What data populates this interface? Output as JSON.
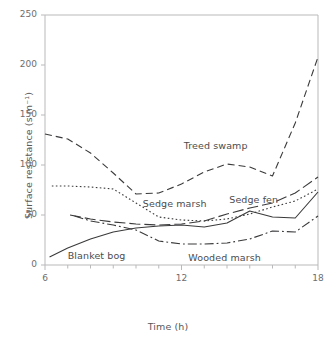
{
  "chart_data": {
    "type": "line",
    "title": "",
    "xlabel": "Time (h)",
    "ylabel": "Surface resistance (s m⁻¹)",
    "xlim": [
      6,
      18
    ],
    "ylim": [
      0,
      250
    ],
    "xticks": [
      6,
      12,
      18
    ],
    "xtick_labels": [
      "6",
      "12",
      "18"
    ],
    "yticks": [
      0,
      50,
      100,
      150,
      200,
      250
    ],
    "ytick_labels": [
      "0",
      "50",
      "100",
      "150",
      "200",
      "250"
    ],
    "x_minor_tick_step": 1,
    "grid": false,
    "legend": "inline-annotations",
    "series": [
      {
        "name": "Treed swamp",
        "style": "dashed",
        "color": "#3a3a3c",
        "label_x": 12.1,
        "label_y": 118,
        "x": [
          6,
          7,
          8,
          9,
          10,
          11,
          12,
          13,
          14,
          15,
          16,
          17,
          18
        ],
        "y": [
          131,
          126,
          112,
          92,
          71,
          72,
          81,
          93,
          101,
          98,
          89,
          142,
          208
        ]
      },
      {
        "name": "Sedge marsh",
        "style": "dotted",
        "color": "#3a3a3c",
        "label_x": 10.3,
        "label_y": 60,
        "x": [
          6.3,
          7,
          8,
          9,
          10,
          11,
          12,
          13,
          14,
          15,
          16,
          17,
          18
        ],
        "y": [
          79,
          79,
          78,
          76,
          62,
          48,
          45,
          44,
          46,
          51,
          58,
          64,
          76
        ]
      },
      {
        "name": "Sedge fen",
        "style": "long-dash",
        "color": "#3a3a3c",
        "label_x": 14.1,
        "label_y": 64,
        "x": [
          7.1,
          8,
          9,
          10,
          11,
          12,
          13,
          14,
          15,
          16,
          17,
          18
        ],
        "y": [
          50,
          46,
          43,
          41,
          40,
          41,
          44,
          51,
          57,
          62,
          72,
          88
        ]
      },
      {
        "name": "Blanket bog",
        "style": "solid",
        "color": "#3a3a3c",
        "label_x": 7.0,
        "label_y": 8,
        "x": [
          6.2,
          7,
          8,
          9,
          10,
          11,
          12,
          13,
          14,
          15,
          16,
          17,
          18
        ],
        "y": [
          8,
          17,
          26,
          33,
          37,
          39,
          40,
          38,
          42,
          54,
          48,
          47,
          73
        ]
      },
      {
        "name": "Wooded marsh",
        "style": "dash-dot",
        "color": "#3a3a3c",
        "label_x": 12.3,
        "label_y": 6,
        "x": [
          7.3,
          8,
          9,
          10,
          11,
          12,
          13,
          14,
          15,
          16,
          17,
          18
        ],
        "y": [
          49,
          44,
          40,
          35,
          24,
          21,
          21,
          22,
          26,
          34,
          33,
          49
        ]
      }
    ]
  },
  "axis": {
    "y_title": "Surface resistance (s m⁻¹)",
    "x_title": "Time (h)"
  }
}
